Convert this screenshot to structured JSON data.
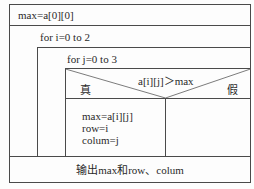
{
  "diagram": {
    "type": "N-S structured flowchart",
    "init": "max=a[0][0]",
    "outer_loop": "for i=0 to 2",
    "inner_loop": "for j=0 to 3",
    "condition": "a[i][j]＞max",
    "true_label": "真",
    "false_label": "假",
    "true_branch": [
      "max=a[i][j]",
      "row=i",
      "colum=j"
    ],
    "output": "输出max和row、colum"
  }
}
